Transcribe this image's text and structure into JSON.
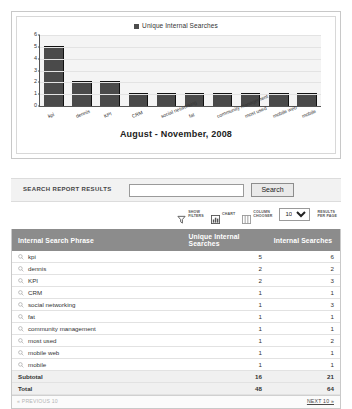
{
  "chart_data": {
    "type": "bar",
    "title": "August - November, 2008",
    "legend": "Unique Internal Searches",
    "legend_position": "top-center",
    "categories": [
      "kpi",
      "dennis",
      "KPI",
      "CRM",
      "social networking",
      "fat",
      "community management",
      "most used",
      "mobile web",
      "mobile"
    ],
    "values": [
      5,
      2,
      2,
      1,
      1,
      1,
      1,
      1,
      1,
      1
    ],
    "xlabel": "",
    "ylabel": "",
    "ylim": [
      0,
      6
    ],
    "yticks": [
      0,
      1,
      2,
      3,
      4,
      5,
      6
    ],
    "ytick_labels": [
      "0",
      "1",
      "2",
      "3",
      "4",
      "5",
      "6"
    ],
    "grid": true,
    "bar_color": "#4a4a4a"
  },
  "search": {
    "label": "SEARCH REPORT RESULTS",
    "value": "",
    "placeholder": "",
    "button_label": "Search"
  },
  "toolbar": {
    "items": [
      {
        "icon": "funnel-icon",
        "label": "SHOW\nFILTERS"
      },
      {
        "icon": "chart-icon",
        "label": "CHART"
      },
      {
        "icon": "columns-icon",
        "label": "COLUMN\nCHOOSER"
      }
    ],
    "results_per_page_value": "10",
    "results_per_page_options": [
      "10",
      "25",
      "50",
      "100"
    ],
    "results_per_page_label": "RESULTS\nPER PAGE"
  },
  "table": {
    "columns": [
      "Internal Search Phrase",
      "Unique Internal Searches",
      "Internal Searches"
    ],
    "row_icon": "magnifier-icon",
    "rows": [
      {
        "phrase": "kpi",
        "unique": "5",
        "total": "6"
      },
      {
        "phrase": "dennis",
        "unique": "2",
        "total": "2"
      },
      {
        "phrase": "KPI",
        "unique": "2",
        "total": "3"
      },
      {
        "phrase": "CRM",
        "unique": "1",
        "total": "1"
      },
      {
        "phrase": "social networking",
        "unique": "1",
        "total": "3"
      },
      {
        "phrase": "fat",
        "unique": "1",
        "total": "1"
      },
      {
        "phrase": "community management",
        "unique": "1",
        "total": "1"
      },
      {
        "phrase": "most used",
        "unique": "1",
        "total": "2"
      },
      {
        "phrase": "mobile web",
        "unique": "1",
        "total": "1"
      },
      {
        "phrase": "mobile",
        "unique": "1",
        "total": "1"
      }
    ],
    "subtotal": {
      "label": "Subtotal",
      "unique": "16",
      "total": "21"
    },
    "grand_total": {
      "label": "Total",
      "unique": "48",
      "total": "64"
    }
  },
  "pagination": {
    "previous_label": "« PREVIOUS 10",
    "next_label": "NEXT 10 »"
  },
  "colors": {
    "header_bg": "#8c8c8c",
    "bar": "#4a4a4a",
    "plot_bg": "#f4f4f4"
  }
}
